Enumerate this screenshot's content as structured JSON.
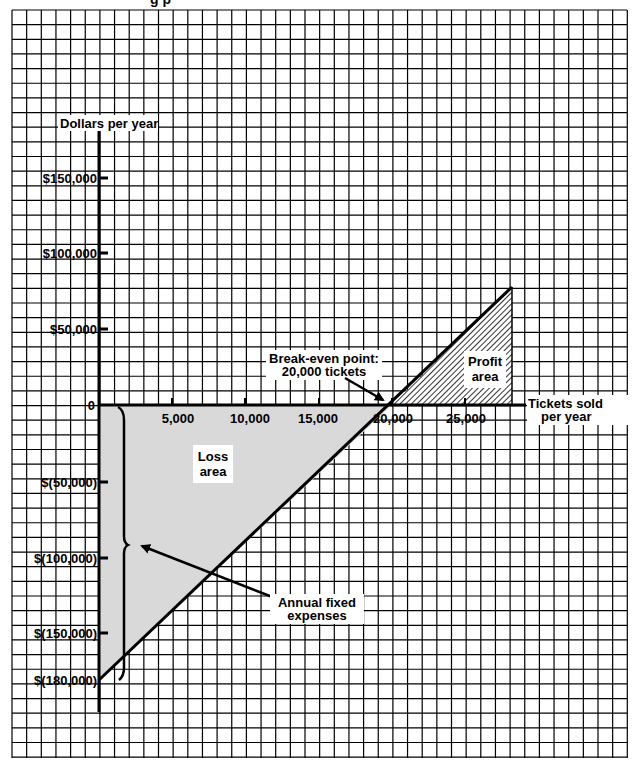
{
  "header": {
    "title_fragment": "g p"
  },
  "chart_data": {
    "type": "line",
    "title": "",
    "xlabel": "Tickets sold per year",
    "ylabel": "Dollars per year",
    "x_ticks": [
      5000,
      10000,
      15000,
      20000,
      25000
    ],
    "x_tick_labels": [
      "5,000",
      "10,000",
      "15,000",
      "20,000",
      "25,000"
    ],
    "y_ticks": [
      150000,
      100000,
      50000,
      0,
      -50000,
      -100000,
      -150000,
      -180000
    ],
    "y_tick_labels": [
      "$150,000",
      "$100,000",
      "$50,000",
      "0",
      "$(50,000)",
      "$(100,000)",
      "$(150,000)",
      "$(180,000)"
    ],
    "xlim": [
      0,
      28200
    ],
    "ylim": [
      -180000,
      80000
    ],
    "grid": true,
    "series": [
      {
        "name": "Net income",
        "x": [
          0,
          20000,
          28200
        ],
        "y": [
          -180000,
          0,
          78000
        ]
      }
    ],
    "annotations": [
      {
        "text": "Break-even point: 20,000 tickets",
        "x": 20000,
        "y": 0
      },
      {
        "text": "Loss area",
        "region": "below zero, 0-20,000 tickets"
      },
      {
        "text": "Profit area",
        "region": "above zero, 20,000+ tickets"
      },
      {
        "text": "Annual fixed expenses",
        "value": -180000
      }
    ]
  },
  "labels": {
    "y_axis_title": "Dollars per year",
    "x_axis_title_line1": "Tickets sold",
    "x_axis_title_line2": "per year",
    "loss_line1": "Loss",
    "loss_line2": "area",
    "profit_line1": "Profit",
    "profit_line2": "area",
    "breakeven_line1": "Break-even point:",
    "breakeven_line2": "20,000 tickets",
    "fixed_line1": "Annual fixed",
    "fixed_line2": "expenses"
  },
  "colors": {
    "loss_fill": "#d9d9d9",
    "grid": "#000000",
    "paper": "#ffffff"
  }
}
